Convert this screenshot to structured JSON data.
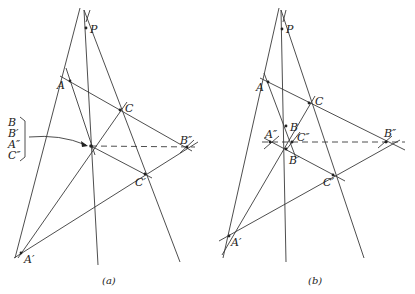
{
  "figure": {
    "panels": [
      {
        "id": "a",
        "caption": "(a)",
        "labels": {
          "P": "P",
          "A": "A",
          "C": "C",
          "B2": "B″",
          "C1": "C′",
          "A1": "A′"
        },
        "stacked_labels": [
          "B",
          "B′",
          "A″",
          "C″"
        ]
      },
      {
        "id": "b",
        "caption": "(b)",
        "labels": {
          "P": "P",
          "A": "A",
          "C": "C",
          "B": "B",
          "A2": "A″",
          "C2": "C″",
          "B2": "B″",
          "B1": "B′",
          "C1": "C′",
          "A1": "A′"
        }
      }
    ]
  }
}
